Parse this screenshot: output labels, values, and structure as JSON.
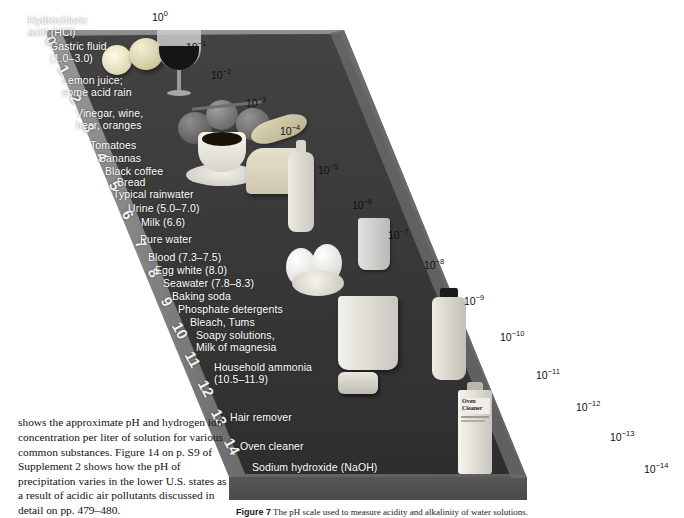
{
  "figure": {
    "ramp_color_top": "#6e6e6e",
    "ramp_color_face": "#3a3a3a",
    "ramp_color_left": "#8a8a8a",
    "label_color": "#ffffff",
    "exponent_color": "#111111"
  },
  "ph_digits": [
    "0",
    "1",
    "2",
    "3",
    "4",
    "5",
    "6",
    "7",
    "8",
    "9",
    "10",
    "11",
    "12",
    "13",
    "14"
  ],
  "exponents": [
    {
      "label": "10",
      "sup": "0"
    },
    {
      "label": "10",
      "sup": "−1"
    },
    {
      "label": "10",
      "sup": "−2"
    },
    {
      "label": "10",
      "sup": "−3"
    },
    {
      "label": "10",
      "sup": "−4"
    },
    {
      "label": "10",
      "sup": "−5"
    },
    {
      "label": "10",
      "sup": "−6"
    },
    {
      "label": "10",
      "sup": "−7"
    },
    {
      "label": "10",
      "sup": "−8"
    },
    {
      "label": "10",
      "sup": "−9"
    },
    {
      "label": "10",
      "sup": "−10"
    },
    {
      "label": "10",
      "sup": "−11"
    },
    {
      "label": "10",
      "sup": "−12"
    },
    {
      "label": "10",
      "sup": "−13"
    },
    {
      "label": "10",
      "sup": "−14"
    }
  ],
  "substances": [
    {
      "text": "Hydrochloric\nacid (HCl)"
    },
    {
      "text": "Gastric fluid\n(1.0–3.0)"
    },
    {
      "text": "Lemon juice;\nsome acid rain"
    },
    {
      "text": "Vinegar, wine,\nbeer, oranges"
    },
    {
      "text": "Tomatoes"
    },
    {
      "text": "Bananas"
    },
    {
      "text": "Black coffee"
    },
    {
      "text": "Bread"
    },
    {
      "text": "Typical rainwater"
    },
    {
      "text": "Urine (5.0–7.0)"
    },
    {
      "text": "Milk (6.6)"
    },
    {
      "text": "Pure water"
    },
    {
      "text": "Blood (7.3–7.5)"
    },
    {
      "text": "Egg white (8.0)"
    },
    {
      "text": "Seawater (7.8–8.3)"
    },
    {
      "text": "Baking soda"
    },
    {
      "text": "Phosphate detergents"
    },
    {
      "text": "Bleach, Tums"
    },
    {
      "text": "Soapy solutions,\nMilk of magnesia"
    },
    {
      "text": "Household ammonia\n(10.5–11.9)"
    },
    {
      "text": "Hair remover"
    },
    {
      "text": "Oven cleaner"
    },
    {
      "text": "Sodium hydroxide (NaOH)"
    }
  ],
  "body_text": "shows the approximate pH and hydrogen ion concentration per liter of solution for various common substances. Figure 14 on p. S9 of Supplement 2 shows how the pH of precipitation varies in the lower U.S. states as a result of acidic air pollutants discussed in detail on pp. 479–480.",
  "caption": {
    "label": "Figure 7",
    "text": "The pH scale used to measure acidity and alkalinity of water solutions."
  },
  "objects": {
    "oven_cleaner_line1": "Oven",
    "oven_cleaner_line2": "Cleaner"
  }
}
